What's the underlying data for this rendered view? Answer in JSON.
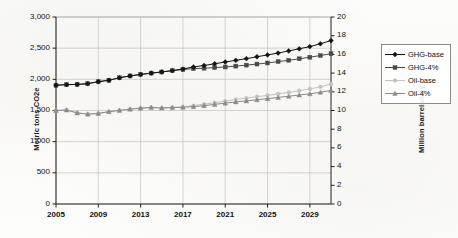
{
  "chart_data": {
    "type": "line",
    "title": "",
    "xlabel": "",
    "ylabel": "Metric tons CO2e",
    "y2label": "Million barrels/day",
    "grid": true,
    "legend_position": "right",
    "xlim": [
      2005,
      2031
    ],
    "ylim": [
      0,
      3000
    ],
    "y2lim": [
      0,
      20
    ],
    "x": [
      2005,
      2006,
      2007,
      2008,
      2009,
      2010,
      2011,
      2012,
      2013,
      2014,
      2015,
      2016,
      2017,
      2018,
      2019,
      2020,
      2021,
      2022,
      2023,
      2024,
      2025,
      2026,
      2027,
      2028,
      2029,
      2030,
      2031
    ],
    "xticks": [
      "2005",
      "2009",
      "2013",
      "2017",
      "2021",
      "2025",
      "2029"
    ],
    "xtick_values": [
      2005,
      2009,
      2013,
      2017,
      2021,
      2025,
      2029
    ],
    "yticks": [
      "0",
      "500",
      "1,000",
      "1,500",
      "2,000",
      "2,500",
      "3,000"
    ],
    "ytick_values": [
      0,
      500,
      1000,
      1500,
      2000,
      2500,
      3000
    ],
    "y2ticks": [
      "0",
      "2",
      "4",
      "6",
      "8",
      "10",
      "12",
      "14",
      "16",
      "18",
      "20"
    ],
    "y2tick_values": [
      0,
      2,
      4,
      6,
      8,
      10,
      12,
      14,
      16,
      18,
      20
    ],
    "series": [
      {
        "name": "GHG-base",
        "axis": "left",
        "color": "#141414",
        "marker": "diamond",
        "values": [
          1905,
          1915,
          1918,
          1930,
          1962,
          1985,
          2025,
          2055,
          2078,
          2100,
          2118,
          2140,
          2165,
          2198,
          2222,
          2250,
          2278,
          2305,
          2332,
          2362,
          2392,
          2422,
          2455,
          2490,
          2525,
          2570,
          2622
        ]
      },
      {
        "name": "GHG-4%",
        "axis": "left",
        "color": "#4a4a4a",
        "marker": "square",
        "values": [
          1905,
          1915,
          1918,
          1930,
          1962,
          1985,
          2025,
          2055,
          2078,
          2100,
          2118,
          2140,
          2158,
          2172,
          2178,
          2188,
          2198,
          2212,
          2228,
          2245,
          2262,
          2285,
          2305,
          2330,
          2355,
          2382,
          2412
        ]
      },
      {
        "name": "Oil-base",
        "axis": "left",
        "color": "#c2c2c2",
        "marker": "circle",
        "values": [
          1500,
          1508,
          1462,
          1442,
          1452,
          1482,
          1502,
          1522,
          1538,
          1548,
          1540,
          1548,
          1558,
          1578,
          1602,
          1625,
          1650,
          1678,
          1700,
          1722,
          1742,
          1768,
          1790,
          1818,
          1845,
          1880,
          1925
        ]
      },
      {
        "name": "Oil-4%",
        "axis": "left",
        "color": "#8a8a8a",
        "marker": "triangle",
        "values": [
          1500,
          1508,
          1462,
          1442,
          1452,
          1482,
          1502,
          1522,
          1538,
          1548,
          1540,
          1548,
          1552,
          1562,
          1578,
          1598,
          1618,
          1638,
          1655,
          1672,
          1690,
          1710,
          1728,
          1748,
          1768,
          1792,
          1822
        ]
      }
    ]
  },
  "legend": {
    "items": [
      {
        "label": "GHG-base"
      },
      {
        "label": "GHG-4%"
      },
      {
        "label": "Oil-base"
      },
      {
        "label": "Oil-4%"
      }
    ]
  }
}
